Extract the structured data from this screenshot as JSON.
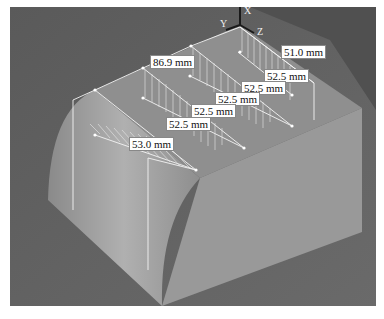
{
  "viewport": {
    "background": "#5e5e5e",
    "model_color": "#9a9a9a",
    "axes": {
      "x": "X",
      "y": "Y",
      "z": "Z"
    }
  },
  "dimensions": [
    {
      "id": "dim-51",
      "label": "51.0 mm",
      "x": 271,
      "y": 45
    },
    {
      "id": "dim-86",
      "label": "86.9 mm",
      "x": 150,
      "y": 55
    },
    {
      "id": "dim-525a",
      "label": "52.5 mm",
      "x": 263,
      "y": 69
    },
    {
      "id": "dim-525b",
      "label": "52.5 mm",
      "x": 241,
      "y": 81
    },
    {
      "id": "dim-525c",
      "label": "52.5 mm",
      "x": 215,
      "y": 92
    },
    {
      "id": "dim-525d",
      "label": "52.5 mm",
      "x": 191,
      "y": 103
    },
    {
      "id": "dim-525e",
      "label": "52.5 mm",
      "x": 165,
      "y": 117
    },
    {
      "id": "dim-530",
      "label": "53.0 mm",
      "x": 129,
      "y": 137
    }
  ]
}
